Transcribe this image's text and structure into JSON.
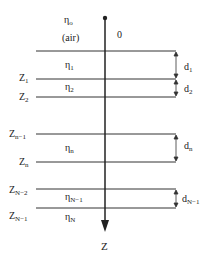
{
  "diagram": {
    "type": "layered-medium",
    "axis": {
      "origin_label": "0",
      "axis_label": "Z"
    },
    "top_medium": {
      "eta": "η",
      "eta_sub": "o",
      "note": "(air)"
    },
    "layers": [
      {
        "eta": "η",
        "eta_sub": "1",
        "thickness": "d",
        "thickness_sub": "1"
      },
      {
        "eta": "η",
        "eta_sub": "2",
        "thickness": "d",
        "thickness_sub": "2"
      },
      {
        "eta": "η",
        "eta_sub": "n",
        "thickness": "d",
        "thickness_sub": "n"
      },
      {
        "eta": "η",
        "eta_sub": "N−1",
        "thickness": "d",
        "thickness_sub": "N−1"
      }
    ],
    "bottom_medium": {
      "eta": "η",
      "eta_sub": "N"
    },
    "boundaries": [
      {
        "z": "Z",
        "z_sub": "1"
      },
      {
        "z": "Z",
        "z_sub": "2"
      },
      {
        "z": "Z",
        "z_sub": "n−1"
      },
      {
        "z": "Z",
        "z_sub": "n"
      },
      {
        "z": "Z",
        "z_sub": "N−2"
      },
      {
        "z": "Z",
        "z_sub": "N−1"
      }
    ]
  }
}
